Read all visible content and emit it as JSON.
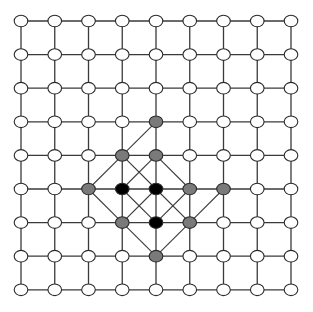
{
  "diagram": {
    "type": "lattice-graph",
    "grid": {
      "cols": 9,
      "rows": 9,
      "origin_x": 21,
      "origin_y": 21,
      "step_x": 33.75,
      "step_y": 33.6
    },
    "node_radius_x": 6.8,
    "node_radius_y": 5.8,
    "colors": {
      "background": "#ffffff",
      "edge": "#3a3a3a",
      "node_stroke": "#2a2a2a",
      "white": "#ffffff",
      "gray": "#7a7a7a",
      "black": "#000000"
    },
    "highlighted_nodes": [
      {
        "col": 4,
        "row": 3,
        "fill": "gray"
      },
      {
        "col": 3,
        "row": 4,
        "fill": "gray"
      },
      {
        "col": 4,
        "row": 4,
        "fill": "gray"
      },
      {
        "col": 2,
        "row": 5,
        "fill": "gray"
      },
      {
        "col": 3,
        "row": 5,
        "fill": "black"
      },
      {
        "col": 4,
        "row": 5,
        "fill": "black"
      },
      {
        "col": 5,
        "row": 5,
        "fill": "gray"
      },
      {
        "col": 6,
        "row": 5,
        "fill": "gray"
      },
      {
        "col": 3,
        "row": 6,
        "fill": "gray"
      },
      {
        "col": 4,
        "row": 6,
        "fill": "black"
      },
      {
        "col": 5,
        "row": 6,
        "fill": "gray"
      },
      {
        "col": 4,
        "row": 7,
        "fill": "gray"
      }
    ],
    "diagonal_edges": [
      [
        [
          4,
          3
        ],
        [
          3,
          4
        ]
      ],
      [
        [
          3,
          4
        ],
        [
          2,
          5
        ]
      ],
      [
        [
          3,
          4
        ],
        [
          4,
          5
        ]
      ],
      [
        [
          4,
          4
        ],
        [
          3,
          5
        ]
      ],
      [
        [
          4,
          4
        ],
        [
          5,
          5
        ]
      ],
      [
        [
          2,
          5
        ],
        [
          3,
          6
        ]
      ],
      [
        [
          3,
          5
        ],
        [
          4,
          6
        ]
      ],
      [
        [
          4,
          5
        ],
        [
          3,
          6
        ]
      ],
      [
        [
          4,
          5
        ],
        [
          5,
          6
        ]
      ],
      [
        [
          5,
          5
        ],
        [
          4,
          6
        ]
      ],
      [
        [
          6,
          5
        ],
        [
          5,
          6
        ]
      ],
      [
        [
          3,
          6
        ],
        [
          4,
          7
        ]
      ],
      [
        [
          5,
          6
        ],
        [
          4,
          7
        ]
      ]
    ]
  }
}
